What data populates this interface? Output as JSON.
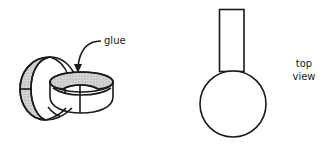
{
  "diagram": {
    "left_figure": {
      "description": "two interlocking paper rings, glued",
      "annotation": "glue",
      "stroke_color": "#1a1a1a",
      "shade_color": "#c8c8c8"
    },
    "right_figure": {
      "description": "top view: rectangle strip attached to circle",
      "annotation_line1": "top",
      "annotation_line2": "view",
      "stroke_color": "#1a1a1a"
    }
  }
}
